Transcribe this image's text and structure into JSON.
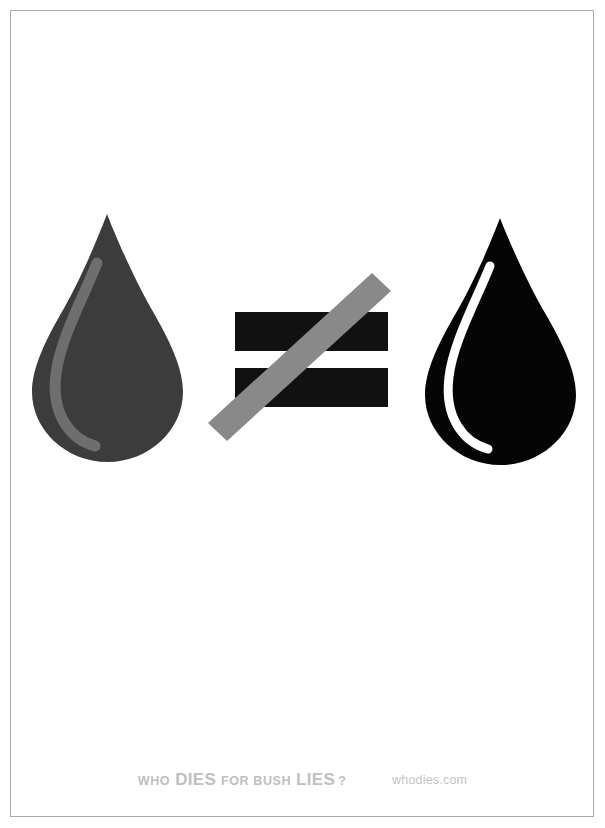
{
  "poster": {
    "title": "Who Dies For Bush Lies",
    "background_color": "#ffffff",
    "frame_color": "#a9a9ab"
  },
  "artwork": {
    "left_drop": {
      "name": "blood-drop-gray",
      "fill_color": "#3c3c3c",
      "highlight_color": "#6e6e6e",
      "label": "gray teardrop"
    },
    "operator": {
      "name": "not-equal-sign",
      "symbol": "≠",
      "bar_color": "#111111",
      "slash_color": "#898989",
      "label": "not equal to"
    },
    "right_drop": {
      "name": "oil-drop-black",
      "fill_color": "#050505",
      "highlight_color": "#ffffff",
      "label": "black teardrop"
    }
  },
  "footer": {
    "tagline": {
      "word1": "WHO",
      "word2": "DIES",
      "word3": "FOR BUSH",
      "word4": "LIES",
      "punctuation": "?",
      "color": "#bfbfbf"
    },
    "site_url": "whodies.com",
    "url_color": "#c4c4c4"
  }
}
